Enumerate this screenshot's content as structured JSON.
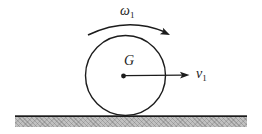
{
  "labels": {
    "angular_velocity": {
      "symbol": "ω",
      "subscript": "1"
    },
    "center_point": "G",
    "velocity": {
      "symbol": "v",
      "subscript": "1"
    }
  },
  "colors": {
    "ink": "#1c1c1c",
    "background": "#ffffff",
    "ground_fill": "#c1c1c1"
  }
}
